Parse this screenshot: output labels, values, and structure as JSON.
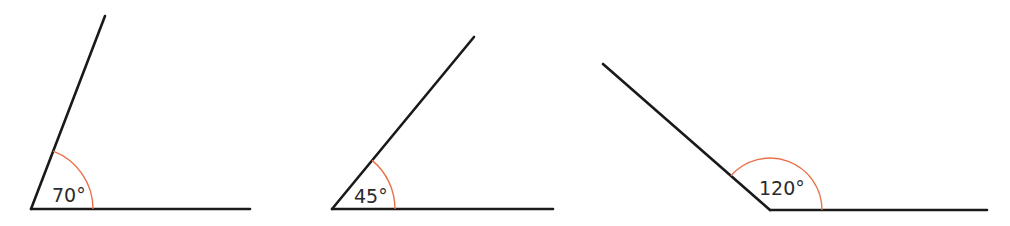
{
  "diagram": {
    "title": "",
    "colors": {
      "line": "#1a1a1a",
      "arc": "#e8734a",
      "text": "#2b2b2b",
      "background": "#ffffff"
    },
    "angles": [
      {
        "label": "70°",
        "degrees": 70,
        "vertex": [
          31,
          209
        ],
        "base_end": [
          250,
          209
        ],
        "arm_end": [
          105,
          16
        ],
        "arc_radius": 62,
        "label_pos": [
          52,
          202
        ]
      },
      {
        "label": "45°",
        "degrees": 45,
        "vertex": [
          332,
          209
        ],
        "base_end": [
          553,
          209
        ],
        "arm_end": [
          474,
          37
        ],
        "arc_radius": 63,
        "label_pos": [
          354,
          203
        ]
      },
      {
        "label": "120°",
        "degrees": 120,
        "vertex": [
          770,
          210
        ],
        "base_end": [
          987,
          210
        ],
        "arm_end": [
          603,
          64
        ],
        "arc_radius": 52,
        "label_pos": [
          759,
          195
        ]
      }
    ]
  }
}
